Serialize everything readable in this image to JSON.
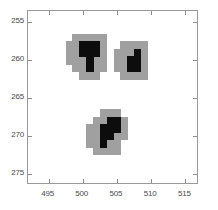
{
  "figure": {
    "background": "#ffffff",
    "axes_color": "#9a9a9a",
    "tick_label_color": "#4a4a4a"
  },
  "chart_data": {
    "type": "heatmap",
    "title": "",
    "xlabel": "",
    "ylabel": "",
    "xlim": [
      492.0,
      517.0
    ],
    "ylim": [
      276.5,
      253.5
    ],
    "y_axis_inverted": true,
    "grid": false,
    "legend": null,
    "xticks": [
      495,
      500,
      505,
      510,
      515
    ],
    "xticklabels": [
      "495",
      "500",
      "505",
      "510",
      "515"
    ],
    "yticks": [
      255,
      260,
      265,
      270,
      275
    ],
    "yticklabels": [
      "255",
      "260",
      "265",
      "270",
      "275"
    ],
    "colors": {
      "halo": "#a0a0a0",
      "core": "#0d0d0d",
      "background": "#ffffff"
    },
    "cell_size": [
      1,
      1
    ],
    "clusters": [
      {
        "name": "cluster-top-left",
        "centroid": [
          501.2,
          259.8
        ],
        "halo_cells": [
          [
            499,
            257
          ],
          [
            500,
            257
          ],
          [
            501,
            257
          ],
          [
            502,
            257
          ],
          [
            503,
            257
          ],
          [
            498,
            258
          ],
          [
            499,
            258
          ],
          [
            500,
            258
          ],
          [
            501,
            258
          ],
          [
            502,
            258
          ],
          [
            503,
            258
          ],
          [
            498,
            259
          ],
          [
            499,
            259
          ],
          [
            500,
            259
          ],
          [
            501,
            259
          ],
          [
            502,
            259
          ],
          [
            503,
            259
          ],
          [
            498,
            260
          ],
          [
            499,
            260
          ],
          [
            500,
            260
          ],
          [
            501,
            260
          ],
          [
            502,
            260
          ],
          [
            503,
            260
          ],
          [
            499,
            261
          ],
          [
            500,
            261
          ],
          [
            501,
            261
          ],
          [
            502,
            261
          ],
          [
            503,
            261
          ],
          [
            500,
            262
          ],
          [
            501,
            262
          ],
          [
            502,
            262
          ]
        ],
        "core_cells": [
          [
            500,
            258
          ],
          [
            501,
            258
          ],
          [
            502,
            258
          ],
          [
            500,
            259
          ],
          [
            501,
            259
          ],
          [
            502,
            259
          ],
          [
            501,
            260
          ],
          [
            501,
            261
          ]
        ]
      },
      {
        "name": "cluster-top-right",
        "centroid": [
          507.6,
          260.4
        ],
        "halo_cells": [
          [
            506,
            258
          ],
          [
            507,
            258
          ],
          [
            508,
            258
          ],
          [
            509,
            258
          ],
          [
            505,
            259
          ],
          [
            506,
            259
          ],
          [
            507,
            259
          ],
          [
            508,
            259
          ],
          [
            509,
            259
          ],
          [
            505,
            260
          ],
          [
            506,
            260
          ],
          [
            507,
            260
          ],
          [
            508,
            260
          ],
          [
            509,
            260
          ],
          [
            505,
            261
          ],
          [
            506,
            261
          ],
          [
            507,
            261
          ],
          [
            508,
            261
          ],
          [
            509,
            261
          ],
          [
            506,
            262
          ],
          [
            507,
            262
          ],
          [
            508,
            262
          ],
          [
            509,
            262
          ]
        ],
        "core_cells": [
          [
            508,
            259
          ],
          [
            507,
            260
          ],
          [
            508,
            260
          ],
          [
            507,
            261
          ],
          [
            508,
            261
          ]
        ]
      },
      {
        "name": "cluster-bottom",
        "centroid": [
          503.6,
          269.8
        ],
        "halo_cells": [
          [
            503,
            267
          ],
          [
            504,
            267
          ],
          [
            505,
            267
          ],
          [
            502,
            268
          ],
          [
            503,
            268
          ],
          [
            504,
            268
          ],
          [
            505,
            268
          ],
          [
            506,
            268
          ],
          [
            501,
            269
          ],
          [
            502,
            269
          ],
          [
            503,
            269
          ],
          [
            504,
            269
          ],
          [
            505,
            269
          ],
          [
            506,
            269
          ],
          [
            501,
            270
          ],
          [
            502,
            270
          ],
          [
            503,
            270
          ],
          [
            504,
            270
          ],
          [
            505,
            270
          ],
          [
            506,
            270
          ],
          [
            501,
            271
          ],
          [
            502,
            271
          ],
          [
            503,
            271
          ],
          [
            504,
            271
          ],
          [
            505,
            271
          ],
          [
            502,
            272
          ],
          [
            503,
            272
          ],
          [
            504,
            272
          ],
          [
            505,
            272
          ]
        ],
        "core_cells": [
          [
            504,
            268
          ],
          [
            505,
            268
          ],
          [
            503,
            269
          ],
          [
            504,
            269
          ],
          [
            505,
            269
          ],
          [
            503,
            270
          ],
          [
            504,
            270
          ],
          [
            503,
            271
          ]
        ]
      }
    ]
  }
}
